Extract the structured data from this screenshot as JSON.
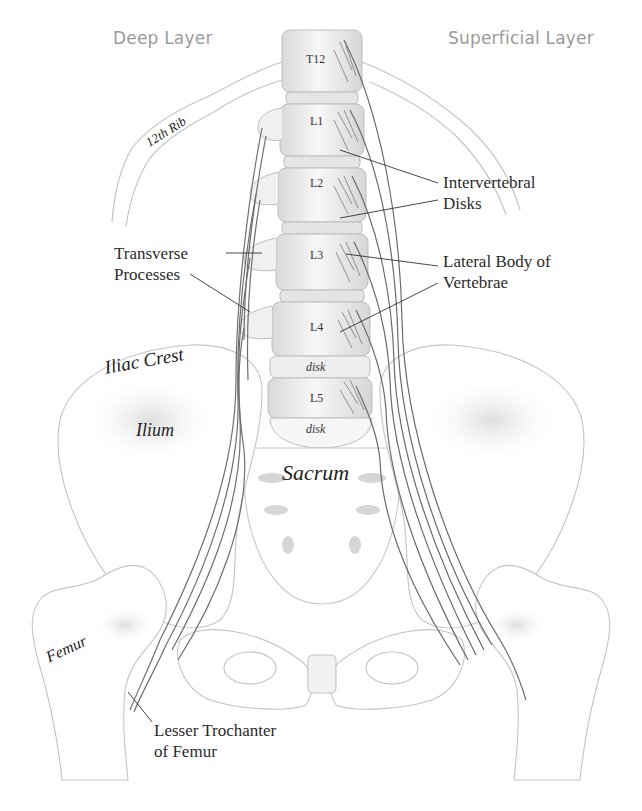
{
  "figure": {
    "colors": {
      "background": "#ffffff",
      "bone_outline": "#bdbdbd",
      "muscle": "#6f6f6f",
      "leader_line": "#333333",
      "heading_text": "#9a9a9a",
      "label_text": "#2b2b2b"
    }
  },
  "headings": {
    "left": "Deep Layer",
    "right": "Superficial Layer"
  },
  "vertebrae": {
    "t12": "T12",
    "l1": "L1",
    "l2": "L2",
    "l3": "L3",
    "l4": "L4",
    "disk1": "disk",
    "l5": "L5",
    "disk2": "disk"
  },
  "regions": {
    "rib": "12th Rib",
    "iliac_crest": "Iliac Crest",
    "ilium": "Ilium",
    "sacrum": "Sacrum",
    "femur": "Femur"
  },
  "callouts": {
    "intervertebral_line1": "Intervertebral",
    "intervertebral_line2": "Disks",
    "transverse_line1": "Transverse",
    "transverse_line2": "Processes",
    "lateral_line1": "Lateral Body of",
    "lateral_line2": "Vertebrae",
    "trochanter_line1": "Lesser Trochanter",
    "trochanter_line2": "of Femur"
  }
}
